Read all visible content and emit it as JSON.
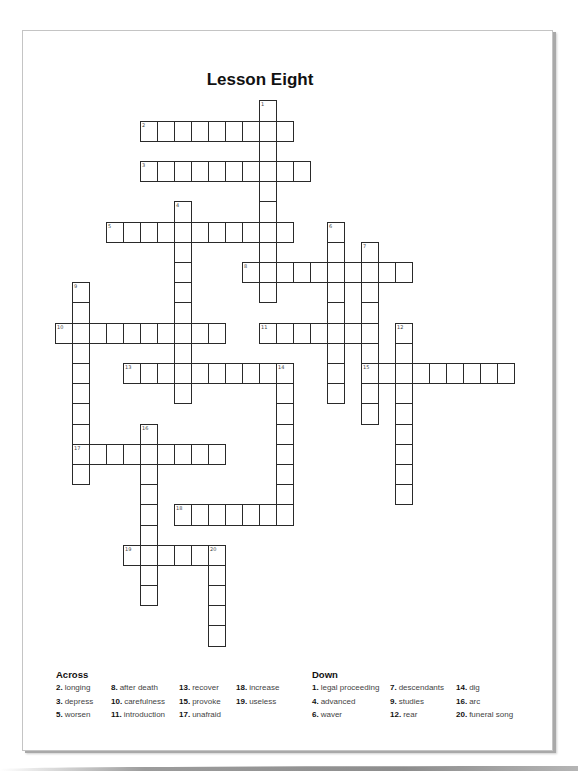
{
  "title": "Lesson Eight",
  "grid": {
    "origin_x": 55.3,
    "origin_y": 100.3,
    "cell_w": 17,
    "cell_h": 20.2,
    "words": [
      {
        "num": 1,
        "dir": "down",
        "row": 0,
        "col": 12,
        "len": 10
      },
      {
        "num": 2,
        "dir": "across",
        "row": 1,
        "col": 5,
        "len": 9
      },
      {
        "num": 3,
        "dir": "across",
        "row": 3,
        "col": 5,
        "len": 10
      },
      {
        "num": 4,
        "dir": "down",
        "row": 5,
        "col": 7,
        "len": 10
      },
      {
        "num": 5,
        "dir": "across",
        "row": 6,
        "col": 3,
        "len": 11
      },
      {
        "num": 6,
        "dir": "down",
        "row": 6,
        "col": 16,
        "len": 9
      },
      {
        "num": 7,
        "dir": "down",
        "row": 7,
        "col": 18,
        "len": 9
      },
      {
        "num": 8,
        "dir": "across",
        "row": 8,
        "col": 11,
        "len": 10
      },
      {
        "num": 9,
        "dir": "down",
        "row": 9,
        "col": 1,
        "len": 10
      },
      {
        "num": 10,
        "dir": "across",
        "row": 11,
        "col": 0,
        "len": 10
      },
      {
        "num": 11,
        "dir": "across",
        "row": 11,
        "col": 12,
        "len": 7
      },
      {
        "num": 12,
        "dir": "down",
        "row": 11,
        "col": 20,
        "len": 9
      },
      {
        "num": 13,
        "dir": "across",
        "row": 13,
        "col": 4,
        "len": 10
      },
      {
        "num": 14,
        "dir": "down",
        "row": 13,
        "col": 13,
        "len": 8
      },
      {
        "num": 15,
        "dir": "across",
        "row": 13,
        "col": 18,
        "len": 9
      },
      {
        "num": 16,
        "dir": "down",
        "row": 16,
        "col": 5,
        "len": 9
      },
      {
        "num": 17,
        "dir": "across",
        "row": 17,
        "col": 1,
        "len": 9
      },
      {
        "num": 18,
        "dir": "across",
        "row": 20,
        "col": 7,
        "len": 7
      },
      {
        "num": 19,
        "dir": "across",
        "row": 22,
        "col": 4,
        "len": 6
      },
      {
        "num": 20,
        "dir": "down",
        "row": 22,
        "col": 9,
        "len": 5
      }
    ]
  },
  "clues": {
    "across": {
      "heading": "Across",
      "items": [
        {
          "num": "2.",
          "text": "longing"
        },
        {
          "num": "3.",
          "text": "depress"
        },
        {
          "num": "5.",
          "text": "worsen"
        },
        {
          "num": "8.",
          "text": "after death"
        },
        {
          "num": "10.",
          "text": "carefulness"
        },
        {
          "num": "11.",
          "text": "introduction"
        },
        {
          "num": "13.",
          "text": "recover"
        },
        {
          "num": "15.",
          "text": "provoke"
        },
        {
          "num": "17.",
          "text": "unafraid"
        },
        {
          "num": "18.",
          "text": "increase"
        },
        {
          "num": "19.",
          "text": "useless"
        }
      ]
    },
    "down": {
      "heading": "Down",
      "items": [
        {
          "num": "1.",
          "text": "legal proceeding"
        },
        {
          "num": "4.",
          "text": "advanced"
        },
        {
          "num": "6.",
          "text": "waver"
        },
        {
          "num": "7.",
          "text": "descendants"
        },
        {
          "num": "9.",
          "text": "studies"
        },
        {
          "num": "12.",
          "text": "rear"
        },
        {
          "num": "14.",
          "text": "dig"
        },
        {
          "num": "16.",
          "text": "arc"
        },
        {
          "num": "20.",
          "text": "funeral song"
        }
      ]
    }
  }
}
